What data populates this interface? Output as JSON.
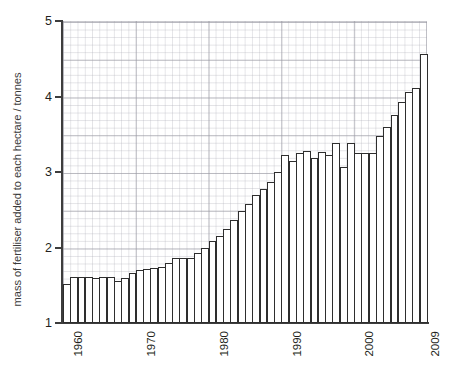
{
  "chart_data": {
    "type": "bar",
    "title": "",
    "subtitle": "",
    "xlabel": "",
    "ylabel": "mass of fertiliser added to each hectare / tonnes",
    "xlim": [
      1960,
      2009
    ],
    "ylim": [
      1,
      5
    ],
    "y_ticks": [
      1,
      2,
      3,
      4,
      5
    ],
    "y_tick_labels": [
      "1",
      "2",
      "3",
      "4",
      "5"
    ],
    "y_minor_step": 0.1,
    "y_major_step": 0.5,
    "x_ticks": [
      1960,
      1970,
      1980,
      1990,
      2000,
      2009
    ],
    "x_tick_labels": [
      "1960",
      "1970",
      "1980",
      "1990",
      "2000",
      "2009"
    ],
    "x_tick_rotation": -90,
    "grid": true,
    "legend": null,
    "legend_position": "none",
    "bar_fill": "#ffffff",
    "bar_edge": "#2e2e2e",
    "axis_color": "#3d3d3d",
    "grid_color": "#aaaab4",
    "categories": [
      "1960",
      "1961",
      "1962",
      "1963",
      "1964",
      "1965",
      "1966",
      "1967",
      "1968",
      "1969",
      "1970",
      "1971",
      "1972",
      "1973",
      "1974",
      "1975",
      "1976",
      "1977",
      "1978",
      "1979",
      "1980",
      "1981",
      "1982",
      "1983",
      "1984",
      "1985",
      "1986",
      "1987",
      "1988",
      "1989",
      "1990",
      "1991",
      "1992",
      "1993",
      "1994",
      "1995",
      "1996",
      "1997",
      "1998",
      "1999",
      "2000",
      "2001",
      "2002",
      "2003",
      "2004",
      "2005",
      "2006",
      "2007",
      "2008",
      "2009"
    ],
    "values": [
      1.52,
      1.61,
      1.61,
      1.61,
      1.6,
      1.61,
      1.61,
      1.55,
      1.59,
      1.66,
      1.7,
      1.72,
      1.73,
      1.74,
      1.8,
      1.86,
      1.86,
      1.86,
      1.93,
      1.99,
      2.08,
      2.15,
      2.25,
      2.36,
      2.48,
      2.58,
      2.69,
      2.78,
      2.87,
      3.0,
      3.22,
      3.14,
      3.25,
      3.28,
      3.19,
      3.26,
      3.23,
      3.38,
      3.07,
      3.38,
      3.25,
      3.25,
      3.25,
      3.48,
      3.6,
      3.76,
      3.93,
      4.06,
      4.11,
      4.56
    ]
  }
}
